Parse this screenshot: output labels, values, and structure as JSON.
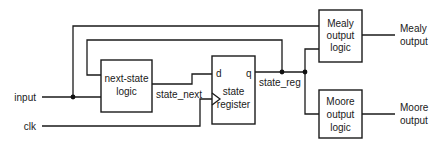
{
  "diagram": {
    "type": "FSM block diagram",
    "blocks": {
      "next_state": {
        "line1": "next-state",
        "line2": "logic"
      },
      "state_register": {
        "d_port": "d",
        "q_port": "q",
        "line1": "state",
        "line2": "register"
      },
      "mealy": {
        "line1": "Mealy",
        "line2": "output",
        "line3": "logic"
      },
      "moore": {
        "line1": "Moore",
        "line2": "output",
        "line3": "logic"
      }
    },
    "signals": {
      "input": "input",
      "clk": "clk",
      "state_next": "state_next",
      "state_reg": "state_reg",
      "mealy_output_line1": "Mealy",
      "mealy_output_line2": "output",
      "moore_output_line1": "Moore",
      "moore_output_line2": "output"
    }
  }
}
